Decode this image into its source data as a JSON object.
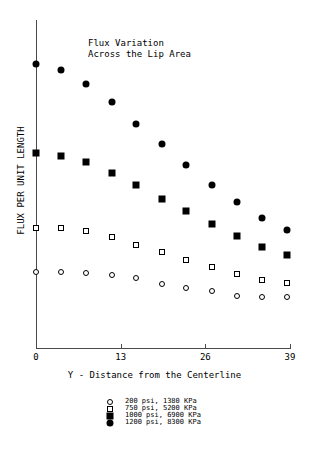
{
  "chart_data": {
    "type": "scatter",
    "title": "Flux Variation\nAcross the Lip Area",
    "title_line1": "Flux Variation",
    "title_line2": "Across the Lip Area",
    "xlabel": "Y - Distance from the Centerline",
    "ylabel": "FLUX PER UNIT LENGTH",
    "xlim": [
      0,
      39
    ],
    "ylim": [
      0,
      100
    ],
    "grid": false,
    "legend_position": "below-axes",
    "xticks": [
      0,
      13,
      26,
      39
    ],
    "xtick_labels": [
      "0",
      "13",
      "26",
      "39"
    ],
    "yticks": [],
    "ytick_labels": [],
    "x": [
      0,
      3.9,
      7.7,
      11.6,
      15.4,
      19.3,
      23.1,
      27.0,
      30.8,
      34.7,
      38.6
    ],
    "series": [
      {
        "name": "200 psi, 1380 KPa",
        "marker": "open-circle",
        "color": "#000000",
        "values": [
          23.1,
          23.1,
          22.9,
          22.4,
          21.2,
          19.4,
          18.2,
          17.3,
          15.9,
          15.6,
          15.4
        ]
      },
      {
        "name": "750 psi, 5200 KPa",
        "marker": "open-square",
        "color": "#000000",
        "values": [
          36.7,
          36.7,
          35.6,
          33.9,
          31.5,
          29.4,
          26.9,
          24.6,
          22.5,
          20.8,
          19.7
        ]
      },
      {
        "name": "1000 psi, 6900 KPa",
        "marker": "filled-square",
        "color": "#000000",
        "values": [
          59.4,
          58.6,
          56.8,
          53.5,
          49.6,
          45.5,
          41.7,
          37.7,
          34.2,
          30.9,
          28.3
        ]
      },
      {
        "name": "1200 psi, 8300 KPa",
        "marker": "filled-circle",
        "color": "#000000",
        "values": [
          86.5,
          84.8,
          80.6,
          75.1,
          68.3,
          62.1,
          55.9,
          49.8,
          44.5,
          39.5,
          35.9
        ]
      }
    ]
  },
  "legend": {
    "entries": [
      {
        "label": "200 psi, 1380 KPa",
        "marker": "open-circle"
      },
      {
        "label": "750 psi, 5200 KPa",
        "marker": "open-square"
      },
      {
        "label": "1000 psi, 6900 KPa",
        "marker": "filled-square"
      },
      {
        "label": "1200 psi, 8300 KPa",
        "marker": "filled-circle"
      }
    ]
  }
}
